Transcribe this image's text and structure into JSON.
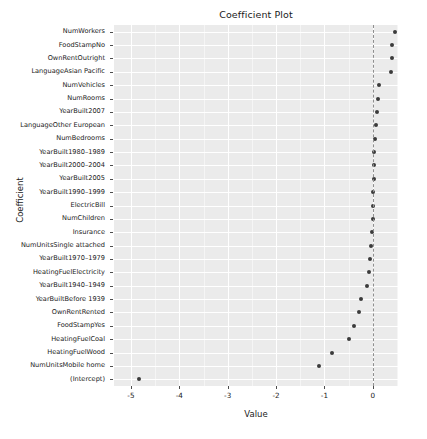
{
  "chart_data": {
    "type": "scatter",
    "title": "Coefficient Plot",
    "xlabel": "Value",
    "ylabel": "Coefficient",
    "xlim": [
      -5.35,
      0.52
    ],
    "x_ticks": [
      -5,
      -4,
      -3,
      -2,
      -1,
      0
    ],
    "x_tick_labels": [
      "-5",
      "-4",
      "-3",
      "-2",
      "-1",
      "0"
    ],
    "grid": true,
    "legend": "none",
    "reference_line": {
      "x": 0,
      "style": "dashed",
      "color": "#8f8f8f"
    },
    "point_color": "#3b3b3b",
    "panel_color": "#ebebeb",
    "categories": [
      "NumWorkers",
      "FoodStampNo",
      "OwnRentOutright",
      "LanguageAsian Pacific",
      "NumVehicles",
      "NumRooms",
      "YearBuilt2007",
      "LanguageOther European",
      "NumBedrooms",
      "YearBuilt1980–1989",
      "YearBuilt2000–2004",
      "YearBuilt2005",
      "YearBuilt1990–1999",
      "ElectricBill",
      "NumChildren",
      "Insurance",
      "NumUnitsSingle attached",
      "YearBuilt1970–1979",
      "HeatingFuelElectricity",
      "YearBuilt1940–1949",
      "YearBuiltBefore 1939",
      "OwnRentRented",
      "FoodStampYes",
      "HeatingFuelCoal",
      "HeatingFuelWood",
      "NumUnitsMobile home",
      "(Intercept)"
    ],
    "values": [
      0.45,
      0.4,
      0.4,
      0.38,
      0.12,
      0.1,
      0.08,
      0.06,
      0.04,
      0.03,
      0.03,
      0.02,
      0.01,
      0.0,
      0.0,
      -0.01,
      -0.03,
      -0.06,
      -0.08,
      -0.12,
      -0.24,
      -0.28,
      -0.38,
      -0.5,
      -0.85,
      -1.12,
      -4.84
    ]
  }
}
